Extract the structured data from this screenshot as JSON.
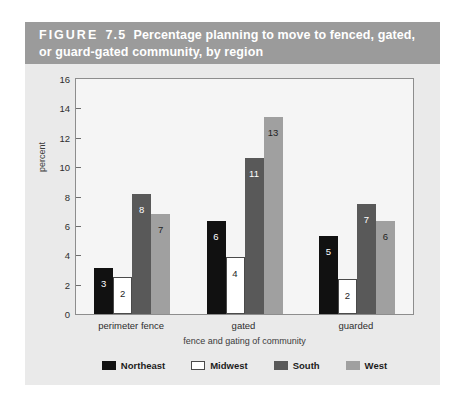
{
  "figure": {
    "label": "FIGURE",
    "number": "7.5",
    "caption": "Percentage planning to move to fenced, gated, or guard-gated community, by region",
    "title_bar_color": "#9b9b9b",
    "title_text_color": "#ffffff",
    "card_background": "#eaeaea",
    "plot_background": "#f5f5f5"
  },
  "chart_data": {
    "type": "bar",
    "xlabel": "fence and gating of community",
    "ylabel": "percent",
    "categories": [
      "perimeter fence",
      "gated",
      "guarded"
    ],
    "series": [
      {
        "name": "Northeast",
        "color": "#111111",
        "values": [
          3,
          6,
          5
        ],
        "bar_heights": [
          3.1,
          6.3,
          5.3
        ]
      },
      {
        "name": "Midwest",
        "color": "#ffffff",
        "values": [
          2,
          4,
          2
        ],
        "bar_heights": [
          2.5,
          3.9,
          2.4
        ]
      },
      {
        "name": "South",
        "color": "#595959",
        "values": [
          8,
          11,
          7
        ],
        "bar_heights": [
          8.2,
          10.6,
          7.5
        ]
      },
      {
        "name": "West",
        "color": "#a0a0a0",
        "values": [
          7,
          13,
          6
        ],
        "bar_heights": [
          6.8,
          13.4,
          6.3
        ]
      }
    ],
    "ylim": [
      0,
      16
    ],
    "yticks": [
      0,
      2,
      4,
      6,
      8,
      10,
      12,
      14,
      16
    ],
    "ytick_labels": [
      "0",
      "2",
      "4",
      "6",
      "8",
      "10",
      "12",
      "14",
      "16"
    ],
    "grid": false,
    "legend_position": "bottom",
    "data_labels": true
  }
}
